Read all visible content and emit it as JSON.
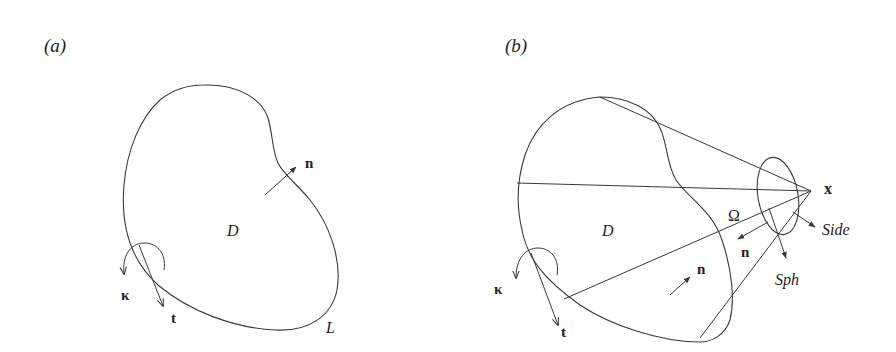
{
  "figure": {
    "panel_a": {
      "label": "(a)",
      "region_label": "D",
      "curve_label": "L",
      "normal_label": "n",
      "tangent_label": "t",
      "curvature_label": "κ"
    },
    "panel_b": {
      "label": "(b)",
      "region_label": "D",
      "apex_label": "x",
      "solid_angle_label": "Ω",
      "side_label": "Side",
      "sphere_label": "Sph",
      "normal_label_inner": "n",
      "normal_label_surface": "n",
      "tangent_label": "t",
      "curvature_label": "κ"
    },
    "colors": {
      "stroke": "#3a3a3a",
      "text": "#222222",
      "background": "#ffffff"
    }
  }
}
